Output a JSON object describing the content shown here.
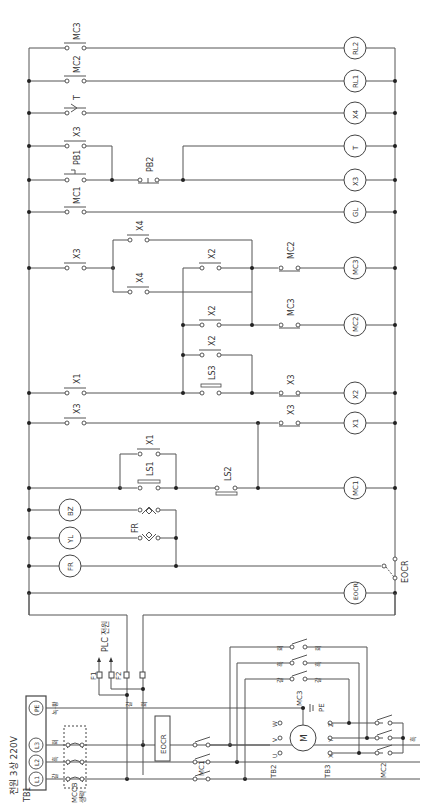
{
  "diagram": {
    "type": "electrical-ladder-and-power-circuit",
    "orientation": "rotated-90-ccw",
    "power_supply": {
      "title": "전원 3상 220V",
      "terminal_block": "TB1",
      "terminals": [
        "L1",
        "L2",
        "L3",
        "PE"
      ],
      "phase_colors": [
        "갈",
        "흑",
        "회",
        "녹-황"
      ],
      "breaker": "MCCB",
      "breaker_note": "생략"
    },
    "plc_supply": {
      "label": "PLC 전원",
      "fuses": [
        "F1",
        "F2"
      ],
      "wire_colors": [
        "갈",
        "회"
      ]
    },
    "power_circuit": {
      "overload": "EOCR",
      "contactors": [
        "MC1",
        "MC2",
        "MC3"
      ],
      "motor": "M",
      "tb2": {
        "label": "TB2",
        "terminals": [
          "U",
          "V",
          "W"
        ],
        "colors": [
          "갈",
          "흑",
          "회"
        ]
      },
      "tb3": {
        "label": "TB3",
        "terminals": [
          "X",
          "Y",
          "Z"
        ],
        "colors": [
          "흑",
          "회",
          "갈"
        ]
      },
      "ground": "PE",
      "mc3_colors_left": [
        "회",
        "흑",
        "갈"
      ],
      "mc3_colors_right": [
        "회",
        "흑",
        "갈"
      ],
      "mc2_color": "흑"
    },
    "rungs": [
      {
        "contacts": [
          "MC3"
        ],
        "coil": "RL2"
      },
      {
        "contacts": [
          "MC2"
        ],
        "coil": "RL1"
      },
      {
        "contacts": [
          "T"
        ],
        "coil": "X4"
      },
      {
        "contacts": [
          "X3",
          "PB1",
          "PB2"
        ],
        "coil": "T"
      },
      {
        "contacts": [
          "MC1",
          "PB1",
          "PB2"
        ],
        "coil": "X3"
      },
      {
        "contacts": [
          "MC1"
        ],
        "coil": "GL"
      },
      {
        "contacts": [
          "X3",
          "X4",
          "X2",
          "MC2"
        ],
        "coil": "MC3"
      },
      {
        "contacts": [
          "X4",
          "X2",
          "MC3"
        ],
        "coil": "MC2"
      },
      {
        "contacts": [
          "X1",
          "LS3",
          "X2",
          "X3"
        ],
        "coil": "X2"
      },
      {
        "contacts": [
          "X3",
          "X3"
        ],
        "coil": "X1"
      },
      {
        "contacts": [
          "LS1",
          "X1",
          "LS2"
        ],
        "coil": "MC1"
      },
      {
        "contacts": [
          "FR"
        ],
        "coil": "BZ"
      },
      {
        "contacts": [
          "FR"
        ],
        "coil": "YL"
      },
      {
        "contacts": [
          "EOCR"
        ],
        "coil": "FR"
      },
      {
        "contacts": [],
        "coil": "EOCR"
      }
    ],
    "labels": {
      "RL2": "RL2",
      "RL1": "RL1",
      "X4": "X4",
      "T": "T",
      "X3": "X3",
      "GL": "GL",
      "MC3": "MC3",
      "MC2": "MC2",
      "X2": "X2",
      "X1": "X1",
      "MC1": "MC1",
      "BZ": "BZ",
      "YL": "YL",
      "FR": "FR",
      "EOCR": "EOCR",
      "PB1": "PB1",
      "PB2": "PB2",
      "LS1": "LS1",
      "LS2": "LS2",
      "LS3": "LS3",
      "TB1": "TB1",
      "TB2": "TB2",
      "TB3": "TB3",
      "MCCB": "MCCB",
      "omit": "생략",
      "M": "M",
      "PE": "PE",
      "F1": "F1",
      "F2": "F2",
      "PLC": "PLC 전원",
      "title": "전원 3상 220V",
      "L1": "L1",
      "L2": "L2",
      "L3": "L3",
      "PEt": "PE",
      "U": "U",
      "V": "V",
      "W": "W",
      "Xt": "X",
      "Yt": "Y",
      "Zt": "Z",
      "brown": "갈",
      "black": "흑",
      "gray": "회",
      "gy": "녹-황"
    }
  }
}
